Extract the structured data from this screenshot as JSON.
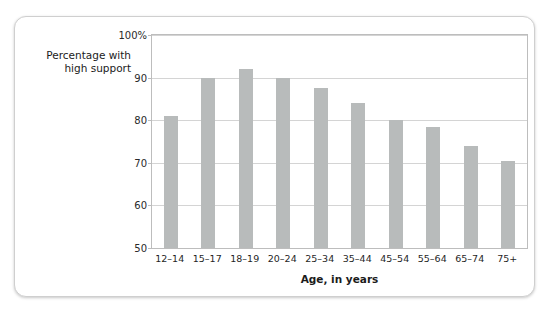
{
  "chart_data": {
    "type": "bar",
    "title": "",
    "ylabel": "Percentage with high support",
    "ylabel_lines": [
      "Percentage with",
      "high support"
    ],
    "xlabel": "Age, in years",
    "categories": [
      "12–14",
      "15–17",
      "18–19",
      "20–24",
      "25–34",
      "35–44",
      "45–54",
      "55–64",
      "65–74",
      "75+"
    ],
    "values": [
      81,
      90,
      92,
      90,
      87.5,
      84,
      80,
      78.5,
      74,
      70.5
    ],
    "ylim": [
      50,
      100
    ],
    "ytick_values": [
      50,
      60,
      70,
      80,
      90,
      100
    ],
    "ytick_labels": [
      "50",
      "60",
      "70",
      "80",
      "90",
      "100%"
    ],
    "grid": true,
    "legend": "none",
    "bar_color": "#b8bbbb",
    "gridline_color": "#d4d4d4",
    "plot_border_color": "#bdbdbd",
    "text_color": "#1b1b1b",
    "card_background": "#ffffff"
  }
}
